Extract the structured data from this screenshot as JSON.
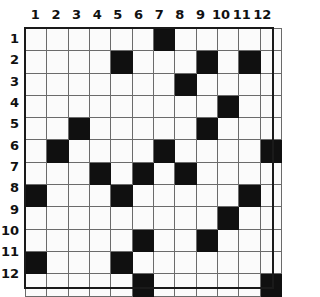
{
  "grid": {
    "title": "Nonogram grid",
    "rows": 12,
    "cols": 12,
    "column_headers": [
      "1",
      "2",
      "3",
      "4",
      "5",
      "6",
      "7",
      "8",
      "9",
      "10",
      "11",
      "12"
    ],
    "row_headers": [
      "1",
      "2",
      "3",
      "4",
      "5",
      "6",
      "7",
      "8",
      "9",
      "10",
      "11",
      "12"
    ],
    "colors": {
      "filled": "#101010",
      "empty": "#fbfbfb",
      "gridline": "#6b6b6b",
      "frame": "#1a1a1a",
      "label": "#111111",
      "page_background": "#ffffff"
    },
    "filled_count": 22,
    "empty_count": 122,
    "filled_cells_by_row": {
      "1": [
        7
      ],
      "2": [
        5,
        9,
        11
      ],
      "3": [
        8
      ],
      "4": [
        10
      ],
      "5": [
        3,
        9
      ],
      "6": [
        2,
        7,
        12
      ],
      "7": [
        4,
        6,
        8
      ],
      "8": [
        1,
        5,
        11
      ],
      "9": [
        10
      ],
      "10": [
        6,
        9
      ],
      "11": [
        1,
        5
      ],
      "12": [
        6,
        12
      ]
    },
    "matrix": [
      [
        0,
        0,
        0,
        0,
        0,
        0,
        1,
        0,
        0,
        0,
        0,
        0
      ],
      [
        0,
        0,
        0,
        0,
        1,
        0,
        0,
        0,
        1,
        0,
        1,
        0
      ],
      [
        0,
        0,
        0,
        0,
        0,
        0,
        0,
        1,
        0,
        0,
        0,
        0
      ],
      [
        0,
        0,
        0,
        0,
        0,
        0,
        0,
        0,
        0,
        1,
        0,
        0
      ],
      [
        0,
        0,
        1,
        0,
        0,
        0,
        0,
        0,
        1,
        0,
        0,
        0
      ],
      [
        0,
        1,
        0,
        0,
        0,
        0,
        1,
        0,
        0,
        0,
        0,
        1
      ],
      [
        0,
        0,
        0,
        1,
        0,
        1,
        0,
        1,
        0,
        0,
        0,
        0
      ],
      [
        1,
        0,
        0,
        0,
        1,
        0,
        0,
        0,
        0,
        0,
        1,
        0
      ],
      [
        0,
        0,
        0,
        0,
        0,
        0,
        0,
        0,
        0,
        1,
        0,
        0
      ],
      [
        0,
        0,
        0,
        0,
        0,
        1,
        0,
        0,
        1,
        0,
        0,
        0
      ],
      [
        1,
        0,
        0,
        0,
        1,
        0,
        0,
        0,
        0,
        0,
        0,
        0
      ],
      [
        0,
        0,
        0,
        0,
        0,
        1,
        0,
        0,
        0,
        0,
        0,
        1
      ]
    ]
  }
}
